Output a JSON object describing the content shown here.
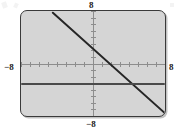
{
  "figure": {
    "kind": "graphing-calculator-viewport",
    "panel_fill": "#d5d5d5",
    "panel_border": "#3a3a3a",
    "axis_color": "#8d8d8d"
  },
  "labels": {
    "top": "8",
    "bottom": "−8",
    "left": "−8",
    "right": "8"
  },
  "chart_data": {
    "type": "line",
    "title": "",
    "subtitle": "",
    "xlabel": "",
    "ylabel": "",
    "xlim": [
      -8,
      8
    ],
    "ylim": [
      -8,
      8
    ],
    "grid": false,
    "legend": "none",
    "axes": {
      "x_axis_at_y": 0,
      "y_axis_at_x": 0,
      "x_tick_interval": 1,
      "y_tick_interval": 1,
      "x_tick_labels": [
        "−8",
        "8"
      ],
      "y_tick_labels": [
        "−8",
        "8"
      ]
    },
    "annotations": [],
    "series": [
      {
        "name": "descending-line",
        "type": "line",
        "color": "#262626",
        "slope": -1.5,
        "intercept": 4.5,
        "x": [
          -4.6,
          8.0
        ],
        "y": [
          8.0,
          -7.5
        ],
        "x_intercept": 3.0,
        "y_intercept": 4.5
      },
      {
        "name": "horizontal-line",
        "type": "line",
        "color": "#4a4a4a",
        "slope": 0,
        "intercept": -3,
        "x": [
          -8.0,
          8.0
        ],
        "y": [
          -3.0,
          -3.0
        ],
        "x_intercept": null,
        "y_intercept": -3.0
      }
    ]
  }
}
